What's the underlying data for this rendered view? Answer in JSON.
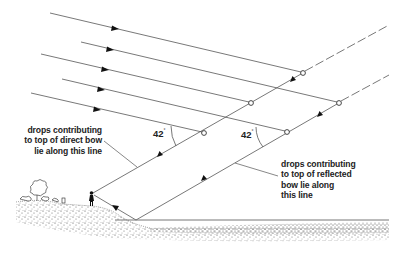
{
  "figure": {
    "type": "rainbow geometry diagram",
    "labels": {
      "direct_bow": [
        "drops contributing",
        "to top of direct bow",
        "lie along this line"
      ],
      "reflected_bow": [
        "drops contributing",
        "to top of reflected",
        "bow lie along",
        "this line"
      ]
    },
    "angles": [
      {
        "value": "42",
        "unit": "°"
      },
      {
        "value": "42",
        "unit": "°"
      }
    ],
    "colors": {
      "line": "#555555",
      "text": "#222222",
      "background": "#ffffff"
    }
  }
}
